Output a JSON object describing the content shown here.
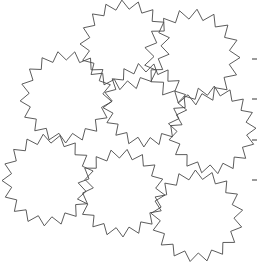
{
  "figure": {
    "title": "",
    "background_color": "#ffffff",
    "stroke_color": "#4a4a4a",
    "width": 260,
    "height": 269,
    "shape_kind": "star-polygon",
    "shape_count": 8,
    "shapes": [
      {
        "name": "star-top-center",
        "cx": 125,
        "cy": 45,
        "outer_r": 45,
        "inner_r": 36,
        "points": 17,
        "rotation": -4
      },
      {
        "name": "star-top-right",
        "cx": 192,
        "cy": 57,
        "outer_r": 48,
        "inner_r": 38,
        "points": 17,
        "rotation": 6
      },
      {
        "name": "star-middle-left",
        "cx": 66,
        "cy": 97,
        "outer_r": 46,
        "inner_r": 37,
        "points": 17,
        "rotation": 11
      },
      {
        "name": "star-center",
        "cx": 145,
        "cy": 105,
        "outer_r": 42,
        "inner_r": 33,
        "points": 17,
        "rotation": -9
      },
      {
        "name": "star-middle-right",
        "cx": 212,
        "cy": 130,
        "outer_r": 44,
        "inner_r": 35,
        "points": 17,
        "rotation": 3
      },
      {
        "name": "star-bottom-left",
        "cx": 48,
        "cy": 180,
        "outer_r": 46,
        "inner_r": 37,
        "points": 17,
        "rotation": -6
      },
      {
        "name": "star-bottom-center",
        "cx": 121,
        "cy": 193,
        "outer_r": 44,
        "inner_r": 35,
        "points": 17,
        "rotation": 8
      },
      {
        "name": "star-bottom-right",
        "cx": 197,
        "cy": 216,
        "outer_r": 46,
        "inner_r": 37,
        "points": 17,
        "rotation": -2
      }
    ],
    "ticks": {
      "edge": "right",
      "x": 252,
      "length": 5,
      "positions": [
        59,
        99,
        140,
        180
      ],
      "labels": [
        "",
        "",
        "",
        ""
      ]
    }
  }
}
